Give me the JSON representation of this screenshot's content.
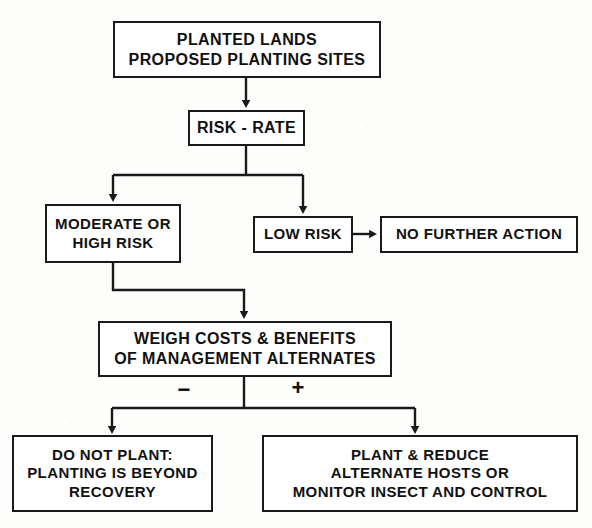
{
  "diagram": {
    "background_color": "#fdfdfc",
    "line_color": "#1a1a1a",
    "text_color": "#111111",
    "nodes": [
      {
        "id": "planted-lands",
        "label": "PLANTED LANDS\nPROPOSED PLANTING SITES",
        "lines": [
          "PLANTED LANDS",
          "PROPOSED PLANTING SITES"
        ]
      },
      {
        "id": "risk-rate",
        "label": "RISK - RATE",
        "lines": [
          "RISK - RATE"
        ]
      },
      {
        "id": "moderate-high-risk",
        "label": "MODERATE OR\nHIGH RISK",
        "lines": [
          "MODERATE OR",
          "HIGH RISK"
        ]
      },
      {
        "id": "low-risk",
        "label": "LOW RISK",
        "lines": [
          "LOW RISK"
        ]
      },
      {
        "id": "no-further-action",
        "label": "NO FURTHER ACTION",
        "lines": [
          "NO FURTHER ACTION"
        ]
      },
      {
        "id": "weigh-costs",
        "label": "WEIGH COSTS & BENEFITS\nOF MANAGEMENT ALTERNATES",
        "lines": [
          "WEIGH COSTS & BENEFITS",
          "OF MANAGEMENT ALTERNATES"
        ]
      },
      {
        "id": "do-not-plant",
        "label": "DO NOT PLANT:\nPLANTING IS BEYOND\nRECOVERY",
        "lines": [
          "DO NOT PLANT:",
          "PLANTING IS BEYOND",
          "RECOVERY"
        ]
      },
      {
        "id": "plant-and-reduce",
        "label": "PLANT & REDUCE\nALTERNATE HOSTS OR\nMONITOR INSECT AND CONTROL",
        "lines": [
          "PLANT & REDUCE",
          "ALTERNATE HOSTS OR",
          "MONITOR INSECT AND CONTROL"
        ]
      }
    ],
    "branch_labels": {
      "negative": "−",
      "positive": "+"
    },
    "edges": [
      {
        "from": "planted-lands",
        "to": "risk-rate",
        "label": ""
      },
      {
        "from": "risk-rate",
        "to": "moderate-high-risk",
        "label": ""
      },
      {
        "from": "risk-rate",
        "to": "low-risk",
        "label": ""
      },
      {
        "from": "low-risk",
        "to": "no-further-action",
        "label": ""
      },
      {
        "from": "moderate-high-risk",
        "to": "weigh-costs",
        "label": ""
      },
      {
        "from": "weigh-costs",
        "to": "do-not-plant",
        "label": "−"
      },
      {
        "from": "weigh-costs",
        "to": "plant-and-reduce",
        "label": "+"
      }
    ]
  }
}
